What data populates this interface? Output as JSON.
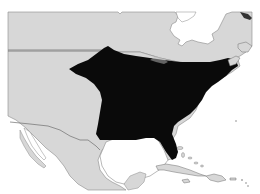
{
  "map": {
    "type": "range-map",
    "region": "North America (United States, southern Canada, Mexico, Caribbean)",
    "highlighted_region": "Eastern United States (species range)",
    "colors": {
      "land": "#d7d7d7",
      "water": "#ffffff",
      "border": "#6e6e6e",
      "range": "#0a0a0a"
    }
  }
}
